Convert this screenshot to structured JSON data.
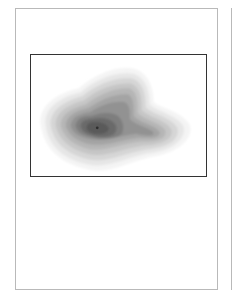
{
  "document": {
    "pages_visible": 2,
    "current_page": {
      "figure": {
        "type": "density-contour-map",
        "colors": {
          "frame": "#333333",
          "levels": [
            "#f2f2f2",
            "#e3e3e3",
            "#d2d2d2",
            "#c2c2c2",
            "#b2b2b2",
            "#a2a2a2",
            "#929292",
            "#808080",
            "#6e6e6e",
            "#5c5c5c"
          ],
          "peak": "#3a3a3a"
        }
      }
    }
  }
}
